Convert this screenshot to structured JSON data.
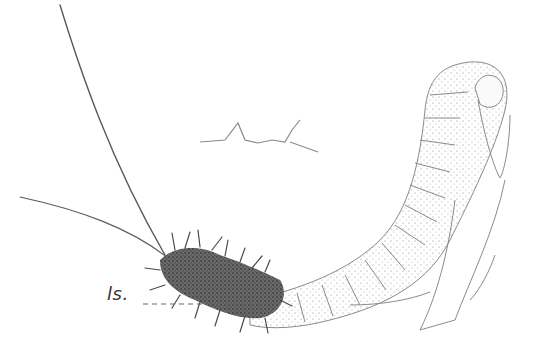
{
  "figure": {
    "labels": [
      {
        "text": "ls.",
        "target": "bristly-segment-region"
      }
    ],
    "colors": {
      "background": "#ffffff",
      "ink": "#555555",
      "dark_stipple": "#4a4a4a",
      "light_stipple": "#9a9a9a"
    }
  }
}
